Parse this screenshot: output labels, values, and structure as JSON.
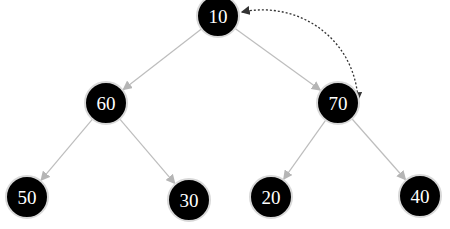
{
  "diagram": {
    "type": "binary-tree",
    "nodes": [
      {
        "id": "n10",
        "label": "10",
        "x": 218,
        "y": 16
      },
      {
        "id": "n60",
        "label": "60",
        "x": 106,
        "y": 103
      },
      {
        "id": "n70",
        "label": "70",
        "x": 338,
        "y": 103
      },
      {
        "id": "n50",
        "label": "50",
        "x": 27,
        "y": 197
      },
      {
        "id": "n30",
        "label": "30",
        "x": 189,
        "y": 200
      },
      {
        "id": "n20",
        "label": "20",
        "x": 271,
        "y": 197
      },
      {
        "id": "n40",
        "label": "40",
        "x": 420,
        "y": 196
      }
    ],
    "edges": [
      {
        "from": "n10",
        "to": "n60"
      },
      {
        "from": "n10",
        "to": "n70"
      },
      {
        "from": "n60",
        "to": "n50"
      },
      {
        "from": "n60",
        "to": "n30"
      },
      {
        "from": "n70",
        "to": "n20"
      },
      {
        "from": "n70",
        "to": "n40"
      }
    ],
    "swap_arrow": {
      "from": "n10",
      "to": "n70",
      "style": "dotted",
      "bidirectional": true
    },
    "colors": {
      "node_fill": "#000000",
      "node_stroke": "#d8d8d8",
      "edge": "#bdbdbd",
      "swap_arrow": "#333333",
      "label": "#ffffff"
    }
  }
}
